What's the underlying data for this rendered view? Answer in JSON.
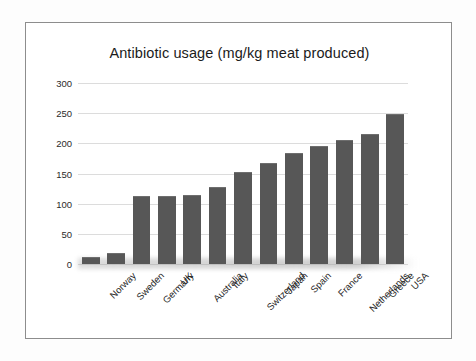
{
  "chart_data": {
    "type": "bar",
    "title": "Antibiotic usage (mg/kg meat produced)",
    "xlabel": "",
    "ylabel": "",
    "ylim": [
      0,
      300
    ],
    "yticks": [
      0,
      50,
      100,
      150,
      200,
      250,
      300
    ],
    "grid": true,
    "legend": false,
    "bar_color": "#575757",
    "categories": [
      "Norway",
      "Sweden",
      "Germany",
      "UK",
      "Australia",
      "Italy",
      "Switzerland",
      "Japan",
      "Spain",
      "France",
      "Netherlands",
      "Greece",
      "USA"
    ],
    "values": [
      12,
      18,
      112,
      112,
      115,
      127,
      153,
      168,
      184,
      195,
      205,
      215,
      248
    ]
  },
  "frame": {
    "border_color": "#8d8d8d",
    "background": "#ffffff"
  }
}
